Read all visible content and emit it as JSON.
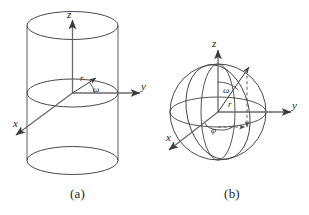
{
  "figure": {
    "background_color": "#ffffff",
    "line_color": "#404040",
    "axis_color": "#595959",
    "text_color": "#1d1d1d",
    "dash_color": "#5a5a5a"
  },
  "panel_a": {
    "caption": "(a)",
    "shape": "cylinder",
    "axes": {
      "z_label": "z",
      "y_label": "y",
      "x_label": "x"
    },
    "annotations": {
      "radius_label": "r",
      "angle_label": "ω"
    }
  },
  "panel_b": {
    "caption": "(b)",
    "shape": "sphere",
    "axes": {
      "z_label": "z",
      "y_label": "y",
      "x_label": "x"
    },
    "annotations": {
      "radius_label": "r",
      "polar_angle_label": "ω",
      "azimuth_angle_label": "φ"
    }
  }
}
